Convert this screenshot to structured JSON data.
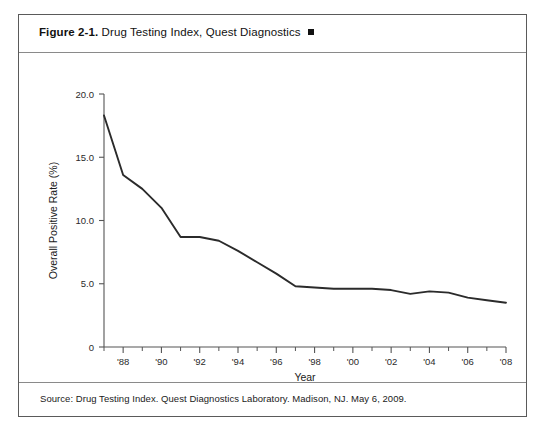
{
  "figure": {
    "number": "Figure 2-1.",
    "caption": "Drug Testing Index, Quest Diagnostics",
    "marker": "square-marker",
    "source": "Source: Drug Testing Index. Quest Diagnostics Laboratory. Madison, NJ. May 6, 2009."
  },
  "chart_data": {
    "type": "line",
    "title": "Drug Testing Index, Quest Diagnostics",
    "xlabel": "Year",
    "ylabel": "Overall Positive Rate (%)",
    "xlim": [
      1987,
      2008
    ],
    "ylim": [
      0,
      20
    ],
    "grid": false,
    "legend": null,
    "y_ticks": [
      0,
      5,
      10,
      15,
      20
    ],
    "y_tick_labels": [
      "0",
      "5.0",
      "10.0",
      "15.0",
      "20.0"
    ],
    "x_ticks": [
      1988,
      1990,
      1992,
      1994,
      1996,
      1998,
      2000,
      2002,
      2004,
      2006,
      2008
    ],
    "x_tick_labels": [
      "'88",
      "'90",
      "'92",
      "'94",
      "'96",
      "'98",
      "'00",
      "'02",
      "'04",
      "'06",
      "'08"
    ],
    "x_minor_ticks": [
      1987,
      1989,
      1991,
      1993,
      1995,
      1997,
      1999,
      2001,
      2003,
      2005,
      2007
    ],
    "series": [
      {
        "name": "Overall Positive Rate",
        "color": "#2b2b2b",
        "x": [
          1987,
          1988,
          1989,
          1990,
          1991,
          1992,
          1993,
          1994,
          1995,
          1996,
          1997,
          1998,
          1999,
          2000,
          2001,
          2002,
          2003,
          2004,
          2005,
          2006,
          2007,
          2008
        ],
        "values": [
          18.3,
          13.6,
          12.5,
          11.0,
          8.7,
          8.7,
          8.4,
          7.6,
          6.7,
          5.8,
          4.8,
          4.7,
          4.6,
          4.6,
          4.6,
          4.5,
          4.2,
          4.4,
          4.3,
          3.9,
          3.7,
          3.5
        ]
      }
    ]
  }
}
